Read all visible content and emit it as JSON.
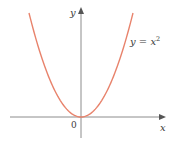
{
  "chart_data": {
    "type": "line",
    "title": "",
    "xlabel": "x",
    "ylabel": "y",
    "origin_label": "0",
    "series": [
      {
        "name": "y = x^2",
        "label_text": "y = x",
        "label_superscript": "2",
        "color": "#e8836c",
        "x": [
          -2.0,
          -1.5,
          -1.0,
          -0.5,
          0.0,
          0.5,
          1.0,
          1.5,
          2.0
        ],
        "y": [
          4.0,
          2.25,
          1.0,
          0.25,
          0.0,
          0.25,
          1.0,
          2.25,
          4.0
        ]
      }
    ],
    "xlim": [
      -2.7,
      3.2
    ],
    "ylim": [
      -0.8,
      4.2
    ],
    "grid": false,
    "legend": "inline label near upper right of curve",
    "axis_color": "#8c8c8c"
  }
}
